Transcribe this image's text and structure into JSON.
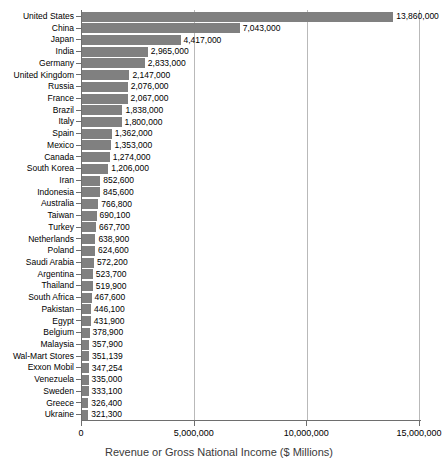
{
  "chart_data": {
    "type": "bar",
    "orientation": "horizontal",
    "title": "",
    "xlabel": "Revenue or Gross National Income ($ Millions)",
    "ylabel": "",
    "xlim": [
      0,
      15000000
    ],
    "xticks": [
      0,
      5000000,
      10000000,
      15000000
    ],
    "xtick_labels": [
      "0",
      "5,000,000",
      "10,000,000",
      "15,000,000"
    ],
    "gridlines": [
      "5,000,000",
      "10,000,000"
    ],
    "grid": true,
    "legend": "none",
    "bar_color": "#808080",
    "categories": [
      "United States",
      "China",
      "Japan",
      "India",
      "Germany",
      "United Kingdom",
      "Russia",
      "France",
      "Brazil",
      "Italy",
      "Spain",
      "Mexico",
      "Canada",
      "South Korea",
      "Iran",
      "Indonesia",
      "Australia",
      "Taiwan",
      "Turkey",
      "Netherlands",
      "Poland",
      "Saudi Arabia",
      "Argentina",
      "Thailand",
      "South Africa",
      "Pakistan",
      "Egypt",
      "Belgium",
      "Malaysia",
      "Wal-Mart Stores",
      "Exxon Mobil",
      "Venezuela",
      "Sweden",
      "Greece",
      "Ukraine"
    ],
    "values": [
      13860000,
      7043000,
      4417000,
      2965000,
      2833000,
      2147000,
      2076000,
      2067000,
      1838000,
      1800000,
      1362000,
      1353000,
      1274000,
      1206000,
      852600,
      845600,
      766800,
      690100,
      667700,
      638900,
      624600,
      572200,
      523700,
      519900,
      467600,
      446100,
      431900,
      378900,
      357900,
      351139,
      347254,
      335000,
      333100,
      326400,
      321300
    ],
    "value_labels": [
      "13,860,000",
      "7,043,000",
      "4,417,000",
      "2,965,000",
      "2,833,000",
      "2,147,000",
      "2,076,000",
      "2,067,000",
      "1,838,000",
      "1,800,000",
      "1,362,000",
      "1,353,000",
      "1,274,000",
      "1,206,000",
      "852,600",
      "845,600",
      "766,800",
      "690,100",
      "667,700",
      "638,900",
      "624,600",
      "572,200",
      "523,700",
      "519,900",
      "467,600",
      "446,100",
      "431,900",
      "378,900",
      "357,900",
      "351,139",
      "347,254",
      "335,000",
      "333,100",
      "326,400",
      "321,300"
    ]
  }
}
